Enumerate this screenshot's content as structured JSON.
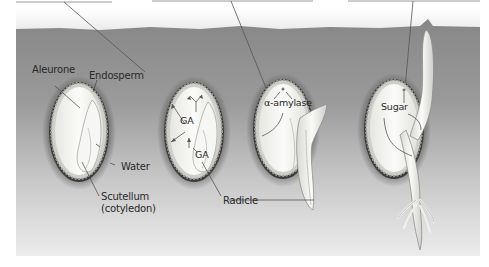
{
  "figure": {
    "type": "seed germination diagram",
    "stages": [
      {
        "id": "stage-1",
        "labels": [
          "Aleurone",
          "Endosperm",
          "Water",
          "Scutellum (cotyledon)"
        ]
      },
      {
        "id": "stage-2",
        "labels": [
          "GA",
          "GA",
          "Radicle"
        ]
      },
      {
        "id": "stage-3",
        "labels": [
          "α-amylase"
        ]
      },
      {
        "id": "stage-4",
        "labels": [
          "Sugar"
        ]
      }
    ]
  },
  "labels": {
    "aleurone": "Aleurone",
    "endosperm": "Endosperm",
    "water": "Water",
    "scutellum_line1": "Scutellum",
    "scutellum_line2": "(cotyledon)",
    "ga_upper": "GA",
    "ga_lower": "GA",
    "radicle": "Radicle",
    "alpha_amylase": "α-amylase",
    "sugar": "Sugar"
  },
  "colors": {
    "soil_top": "#8b8b8b",
    "soil_bottom": "#ebebeb",
    "seed_fill": "#f4f4f2",
    "seed_outline": "#3a3a3a",
    "aleurone_layer": "#c9c9c4",
    "leader_line": "#5a5a5a"
  }
}
